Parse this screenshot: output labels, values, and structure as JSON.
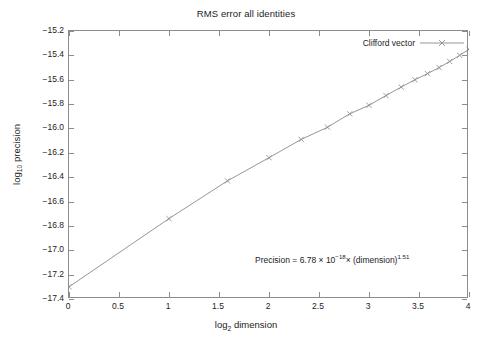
{
  "chart_data": {
    "type": "line",
    "title": "RMS error all identities",
    "xlabel_parts": {
      "base": "log",
      "sub": "2",
      "rest": " dimension"
    },
    "ylabel_parts": {
      "base": "log",
      "sub": "10",
      "rest": " precision"
    },
    "xlabel": "log2 dimension",
    "ylabel": "log10 precision",
    "xlim": [
      0,
      4
    ],
    "ylim": [
      -17.4,
      -15.2
    ],
    "xticks": [
      0,
      0.5,
      1,
      1.5,
      2,
      2.5,
      3,
      3.5,
      4
    ],
    "xtick_labels": [
      "0",
      "0.5",
      "1",
      "1.5",
      "2",
      "2.5",
      "3",
      "3.5",
      "4"
    ],
    "yticks": [
      -15.2,
      -15.4,
      -15.6,
      -15.8,
      -16.0,
      -16.2,
      -16.4,
      -16.6,
      -16.8,
      -17.0,
      -17.2,
      -17.4
    ],
    "ytick_labels": [
      "-15.2",
      "-15.4",
      "-15.6",
      "-15.8",
      "-16.0",
      "-16.2",
      "-16.4",
      "-16.6",
      "-16.8",
      "-17.0",
      "-17.2",
      "-17.4"
    ],
    "grid": false,
    "legend_position": "top-right-inside",
    "series": [
      {
        "name": "Clifford vector",
        "color": "#8a8a8a",
        "marker": "x",
        "x": [
          0,
          1.0,
          1.585,
          2.0,
          2.322,
          2.585,
          2.807,
          3.0,
          3.17,
          3.322,
          3.459,
          3.585,
          3.7,
          3.807,
          3.907,
          4.0
        ],
        "y": [
          -17.3,
          -16.74,
          -16.43,
          -16.24,
          -16.09,
          -15.99,
          -15.88,
          -15.81,
          -15.73,
          -15.66,
          -15.6,
          -15.55,
          -15.5,
          -15.45,
          -15.4,
          -15.35
        ]
      }
    ],
    "annotation": {
      "prefix": "Precision = 6.78 × 10",
      "exponent1": "−18",
      "middle": "× (dimension)",
      "exponent2": "1.51",
      "text": "Precision = 6.78 × 10⁻¹⁸ × (dimension)^1.51"
    }
  },
  "legend": {
    "entries": [
      {
        "label": "Clifford vector",
        "color": "#8a8a8a",
        "marker": "x"
      }
    ]
  },
  "colors": {
    "background": "#ffffff",
    "frame": "#8c8c8c",
    "series": "#8a8a8a",
    "text": "#1c1c1c"
  }
}
